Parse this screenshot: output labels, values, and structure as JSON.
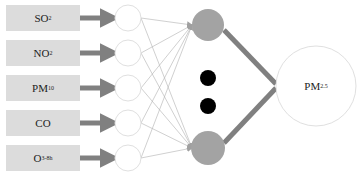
{
  "diagram": {
    "type": "neural-network",
    "inputs": [
      {
        "base": "SO",
        "sub": "2"
      },
      {
        "base": "NO",
        "sub": "2"
      },
      {
        "base": "PM",
        "sub": "10"
      },
      {
        "base": "CO",
        "sub": ""
      },
      {
        "base": "O",
        "sub": "3-8h"
      }
    ],
    "hidden_layer": {
      "visible_nodes": 2,
      "ellipsis_dots": 2
    },
    "output": {
      "base": "PM",
      "sub": "2.5"
    },
    "colors": {
      "input_box": "#dcdcdc",
      "arrow": "#808080",
      "hidden_node": "#a3a3a3",
      "ellipsis_dot": "#000000",
      "connection_line": "#b0b0b0",
      "node_outline": "#e0e0e0"
    }
  }
}
